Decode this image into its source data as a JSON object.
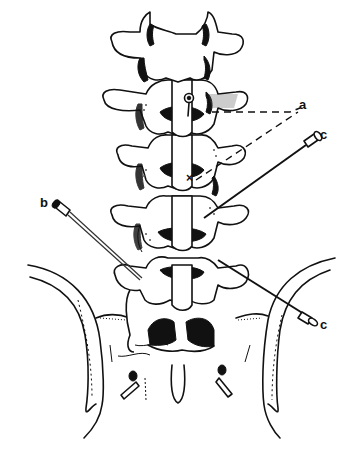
{
  "figure": {
    "labels": {
      "a": "a",
      "b": "b",
      "c_upper": "c",
      "c_lower": "c",
      "x_mark": "×"
    },
    "colors": {
      "ink": "#111111",
      "background": "#ffffff"
    }
  }
}
